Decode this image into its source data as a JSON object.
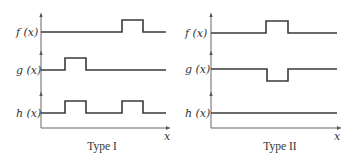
{
  "panels": [
    {
      "caption": "Type I",
      "signals": [
        {
          "label": "f (x)",
          "description": "low baseline with one pulse up late",
          "pulses": [
            {
              "start": 0.64,
              "end": 0.81,
              "direction": "up"
            }
          ]
        },
        {
          "label": "g (x)",
          "description": "low baseline with one pulse up early",
          "pulses": [
            {
              "start": 0.19,
              "end": 0.36,
              "direction": "up"
            }
          ]
        },
        {
          "label": "h (x)",
          "description": "sum: two pulses up",
          "pulses": [
            {
              "start": 0.19,
              "end": 0.36,
              "direction": "up"
            },
            {
              "start": 0.64,
              "end": 0.81,
              "direction": "up"
            }
          ]
        }
      ],
      "x_axis_label": "x"
    },
    {
      "caption": "Type II",
      "signals": [
        {
          "label": "f (x)",
          "description": "baseline with pulse up in middle",
          "pulses": [
            {
              "start": 0.44,
              "end": 0.61,
              "direction": "up"
            }
          ]
        },
        {
          "label": "g (x)",
          "description": "baseline with pulse down in middle",
          "pulses": [
            {
              "start": 0.44,
              "end": 0.61,
              "direction": "down"
            }
          ]
        },
        {
          "label": "h (x)",
          "description": "sum: flat line",
          "pulses": []
        }
      ],
      "x_axis_label": "x"
    }
  ],
  "colors": {
    "line": "#3a3a3a",
    "axis": "#555555",
    "text": "#333333",
    "background": "#ffffff"
  }
}
